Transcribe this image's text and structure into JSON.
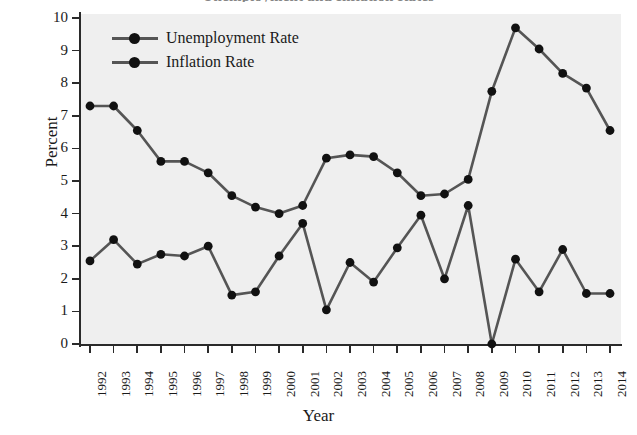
{
  "figure": {
    "title": "Unemployment and Inflation Rates",
    "title_note": "cropped-at-top"
  },
  "axes": {
    "ylabel": "Percent",
    "xlabel": "Year",
    "yticks": [
      "0",
      "1",
      "2",
      "3",
      "4",
      "5",
      "6",
      "7",
      "8",
      "9",
      "10"
    ]
  },
  "legend": {
    "items": [
      {
        "label": "Unemployment Rate",
        "color": "#555555",
        "marker_color": "#111111"
      },
      {
        "label": "Inflation Rate",
        "color": "#555555",
        "marker_color": "#111111"
      }
    ]
  },
  "chart_data": {
    "type": "line",
    "title": "Unemployment and Inflation Rates",
    "xlabel": "Year",
    "ylabel": "Percent",
    "ylim": [
      0,
      10
    ],
    "grid": false,
    "legend_position": "top-left",
    "categories": [
      "1992",
      "1993",
      "1994",
      "1995",
      "1996",
      "1997",
      "1998",
      "1999",
      "2000",
      "2001",
      "2002",
      "2003",
      "2004",
      "2005",
      "2006",
      "2007",
      "2008",
      "2009",
      "2010",
      "2011",
      "2012",
      "2013",
      "2014"
    ],
    "series": [
      {
        "name": "Unemployment Rate",
        "color": "#555555",
        "values": [
          7.3,
          7.3,
          6.55,
          5.6,
          5.6,
          5.25,
          4.55,
          4.2,
          4.0,
          4.25,
          5.7,
          5.8,
          5.75,
          5.25,
          4.55,
          4.6,
          5.05,
          7.75,
          9.7,
          9.05,
          8.3,
          7.85,
          6.55
        ]
      },
      {
        "name": "Inflation Rate",
        "color": "#555555",
        "values": [
          2.55,
          3.2,
          2.45,
          2.75,
          2.7,
          3.0,
          1.5,
          1.6,
          2.7,
          3.7,
          1.05,
          2.5,
          1.9,
          2.95,
          3.95,
          2.0,
          4.25,
          0.0,
          2.6,
          1.6,
          2.9,
          1.55,
          1.55
        ]
      }
    ]
  }
}
